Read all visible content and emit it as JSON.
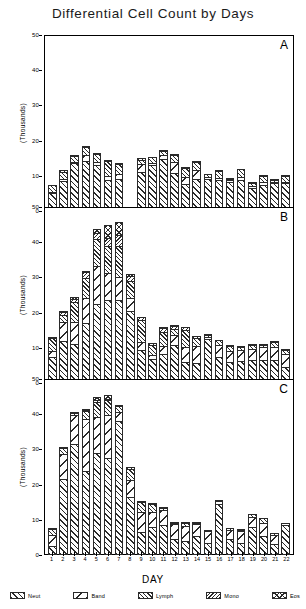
{
  "chart_data": {
    "type": "bar",
    "title": "Differential Cell Count by Days",
    "xlabel": "DAY",
    "ylabel": "(Thousands)",
    "stacked": true,
    "grid": false,
    "legend_position": "bottom",
    "ylim": [
      0,
      50
    ],
    "yticks": [
      0,
      10,
      20,
      30,
      40,
      50
    ],
    "categories": [
      "1",
      "2",
      "3",
      "4",
      "5",
      "6",
      "7",
      "8",
      "9",
      "10",
      "11",
      "12",
      "13",
      "14",
      "15",
      "16",
      "17",
      "18",
      "19",
      "20",
      "21",
      "22"
    ],
    "legend": [
      "Neut",
      "Band",
      "Lymph",
      "Mono",
      "Eos"
    ],
    "panels": [
      {
        "letter": "A",
        "series": [
          {
            "name": "Neut",
            "values": [
              5.0,
              8.5,
              13.5,
              14.3,
              13.0,
              8.8,
              9.2,
              0,
              11.2,
              13.0,
              14.8,
              10.8,
              7.8,
              9.0,
              9.0,
              8.8,
              8.3,
              8.8,
              6.5,
              7.5,
              8.0,
              8.0
            ]
          },
          {
            "name": "Band",
            "values": [
              0.6,
              1.0,
              0.8,
              2.0,
              1.2,
              1.5,
              1.5,
              0,
              2.5,
              1.0,
              1.5,
              3.4,
              2.2,
              2.8,
              0.9,
              1.0,
              0.7,
              1.1,
              0.9,
              1.0,
              0.5,
              0.6
            ]
          },
          {
            "name": "Lymph",
            "values": [
              2.3,
              2.2,
              2.0,
              2.5,
              2.6,
              4.5,
              3.2,
              0,
              1.4,
              1.8,
              1.3,
              2.3,
              2.9,
              2.8,
              1.1,
              2.0,
              0.7,
              2.6,
              1.2,
              2.0,
              1.0,
              2.0
            ]
          },
          {
            "name": "Mono",
            "values": [
              0.4,
              0.9,
              0.5,
              0.5,
              0.5,
              0.6,
              0.5,
              0,
              0.7,
              0.5,
              0.5,
              0.6,
              0.6,
              0.5,
              0.4,
              0.6,
              0.4,
              0.4,
              0.4,
              0.5,
              0.4,
              0.5
            ]
          },
          {
            "name": "Eos",
            "values": [
              0.2,
              0.3,
              0.2,
              0.2,
              0.2,
              0.3,
              0.2,
              0,
              0.2,
              0.2,
              0.2,
              0.2,
              0.2,
              0.2,
              0.2,
              0.2,
              0.2,
              0.2,
              0.2,
              0.2,
              0.2,
              0.3
            ]
          }
        ]
      },
      {
        "letter": "B",
        "series": [
          {
            "name": "Neut",
            "values": [
              7.5,
              12.0,
              11.0,
              17.0,
              22.5,
              23.5,
              23.5,
              20.5,
              9.5,
              6.8,
              8.2,
              10.8,
              6.0,
              5.8,
              12.5,
              7.5,
              6.0,
              6.2,
              6.5,
              6.5,
              6.5,
              4.5
            ]
          },
          {
            "name": "Band",
            "values": [
              2.0,
              5.5,
              6.5,
              7.5,
              11.0,
              8.0,
              7.0,
              4.0,
              2.5,
              1.5,
              2.5,
              3.0,
              4.5,
              5.0,
              0.8,
              3.5,
              3.5,
              3.5,
              3.5,
              4.0,
              4.0,
              4.0
            ]
          },
          {
            "name": "Lymph",
            "values": [
              3.8,
              2.5,
              6.0,
              6.0,
              8.0,
              8.0,
              9.0,
              5.0,
              6.5,
              3.0,
              4.5,
              2.2,
              5.0,
              2.5,
              0.9,
              1.8,
              1.6,
              1.2,
              1.4,
              1.0,
              1.8,
              1.5
            ]
          },
          {
            "name": "Mono",
            "values": [
              0.5,
              1.0,
              1.2,
              1.8,
              2.0,
              2.5,
              3.5,
              1.8,
              1.2,
              0.8,
              1.2,
              1.0,
              1.2,
              0.8,
              0.5,
              0.4,
              0.5,
              0.5,
              0.5,
              0.5,
              0.5,
              0.4
            ]
          },
          {
            "name": "Eos",
            "values": [
              0.2,
              0.5,
              0.8,
              0.7,
              1.5,
              4.0,
              4.0,
              0.7,
              0.3,
              0.4,
              0.6,
              0.5,
              0.3,
              0.3,
              0.3,
              0.3,
              0.4,
              0.4,
              0.3,
              0.3,
              0.2,
              0.2
            ]
          }
        ]
      },
      {
        "letter": "C",
        "series": [
          {
            "name": "Neut",
            "values": [
              2.5,
              21.5,
              31.5,
              24.0,
              29.0,
              27.5,
              38.0,
              16.5,
              6.5,
              8.0,
              8.5,
              4.5,
              4.0,
              5.5,
              3.5,
              14.5,
              4.5,
              3.5,
              8.0,
              5.5,
              3.0,
              8.5
            ]
          },
          {
            "name": "Band",
            "values": [
              3.5,
              7.5,
              8.5,
              15.0,
              10.5,
              12.5,
              3.0,
              5.0,
              6.0,
              4.5,
              4.5,
              4.5,
              4.5,
              3.5,
              3.5,
              1.0,
              3.0,
              3.5,
              3.0,
              4.0,
              3.0,
              0.8
            ]
          },
          {
            "name": "Lymph",
            "values": [
              2.0,
              2.0,
              1.0,
              2.5,
              4.5,
              4.5,
              2.0,
              3.5,
              3.0,
              2.5,
              1.0,
              0.8,
              1.2,
              0.8,
              0.8,
              0.6,
              0.8,
              0.8,
              1.2,
              1.5,
              0.8,
              0.3
            ]
          },
          {
            "name": "Mono",
            "values": [
              0.4,
              0.5,
              0.4,
              0.6,
              0.8,
              0.8,
              0.5,
              0.8,
              0.6,
              0.5,
              0.4,
              0.3,
              0.4,
              0.3,
              0.3,
              0.3,
              0.3,
              0.4,
              0.4,
              0.4,
              0.3,
              0.2
            ]
          },
          {
            "name": "Eos",
            "values": [
              0.2,
              0.3,
              0.2,
              0.4,
              1.2,
              1.2,
              0.3,
              0.4,
              0.3,
              0.3,
              0.2,
              0.2,
              0.2,
              0.2,
              0.2,
              0.2,
              0.2,
              0.2,
              0.2,
              0.2,
              0.2,
              0.1
            ]
          }
        ]
      }
    ]
  }
}
